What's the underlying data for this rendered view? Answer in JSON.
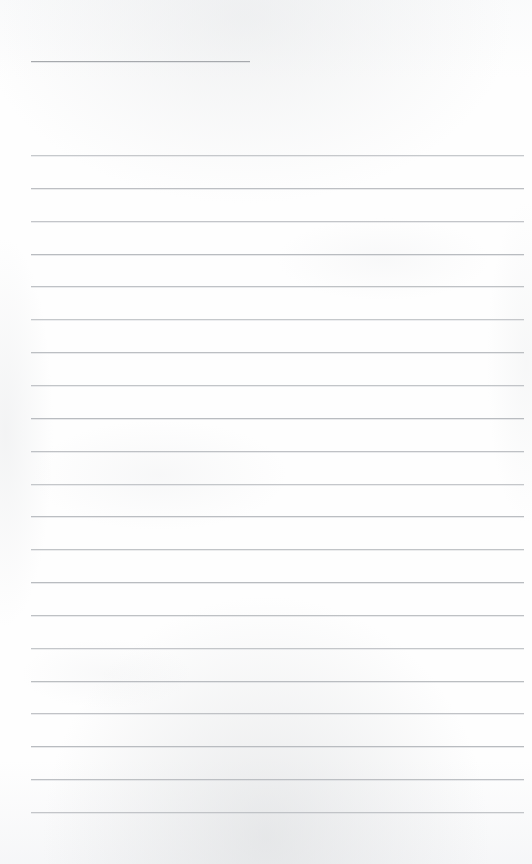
{
  "document": {
    "kind": "scanned-ruled-notebook-page",
    "title_text": "",
    "body_text": "",
    "page_width": 532,
    "page_height": 864,
    "background_color": "#fefefe",
    "rule_color": "#b9bcc0",
    "heading_rule_color": "#a6a9ad",
    "is_blank": true
  },
  "heading_rule": {
    "name": "title-underline",
    "x": 31,
    "y": 61,
    "width": 219
  },
  "ruled_lines": {
    "left": 31,
    "right_edge": 524,
    "width": 493,
    "first_y": 155,
    "spacing": 32.85,
    "count": 21,
    "y_positions": [
      155,
      188,
      221,
      254,
      286,
      319,
      352,
      385,
      418,
      451,
      484,
      516,
      549,
      582,
      615,
      648,
      681,
      713,
      746,
      779,
      812
    ]
  }
}
